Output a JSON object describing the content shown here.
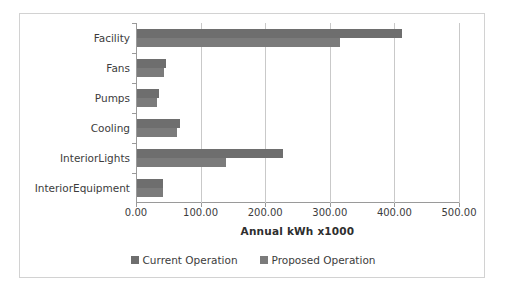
{
  "chart_data": {
    "type": "bar",
    "orientation": "horizontal",
    "title": "",
    "xlabel": "Annual kWh x1000",
    "ylabel": "",
    "xlim": [
      0,
      500
    ],
    "xticks": [
      0,
      100,
      200,
      300,
      400,
      500
    ],
    "xtick_labels": [
      "0.00",
      "100.00",
      "200.00",
      "300.00",
      "400.00",
      "500.00"
    ],
    "grid": true,
    "legend_position": "bottom",
    "categories": [
      "Facility",
      "Fans",
      "Pumps",
      "Cooling",
      "InteriorLights",
      "InteriorEquipment"
    ],
    "series": [
      {
        "name": "Current Operation",
        "color": "#6e6e6e",
        "values": [
          410,
          45,
          34,
          66,
          226,
          40
        ]
      },
      {
        "name": "Proposed Operation",
        "color": "#7b7b7b",
        "values": [
          315,
          42,
          31,
          62,
          138,
          40
        ]
      }
    ]
  },
  "legend": {
    "items": [
      {
        "label": "Current Operation",
        "color": "#6e6e6e"
      },
      {
        "label": "Proposed Operation",
        "color": "#7b7b7b"
      }
    ]
  }
}
